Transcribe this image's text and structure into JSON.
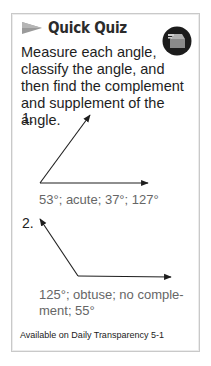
{
  "header": {
    "title": "Quick Quiz",
    "arrow_icon": "right-pointing-triangle-icon",
    "badge_icon": "transparency-projector-icon"
  },
  "prompt": "Measure each angle, classify the angle, and then find the complement and supplement of the angle.",
  "questions": [
    {
      "number": "1.",
      "angle_degrees": 53,
      "answer": "53°; acute; 37°; 127°"
    },
    {
      "number": "2.",
      "angle_degrees": 125,
      "answer_line1": "125°; obtuse; no comple-",
      "answer_line2": "ment; 55°"
    }
  ],
  "footer": "Available on Daily Transparency 5-1",
  "colors": {
    "border": "#c9c9c9",
    "title": "#2b2b2b",
    "answer": "#666666",
    "arrow": "#9a9a9a"
  }
}
